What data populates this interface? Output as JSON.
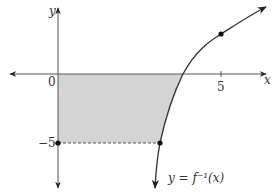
{
  "diagram": {
    "type": "function-graph",
    "function_label": "y = f⁻¹(x)",
    "axes": {
      "x_label": "x",
      "y_label": "y",
      "origin_label": "0",
      "x_tick_labels": [
        "5"
      ],
      "y_tick_labels": [
        "−5"
      ]
    },
    "points": [
      {
        "x": 5,
        "y": 3,
        "note": "point on curve above x-axis"
      },
      {
        "x": 0,
        "y": -5,
        "note": "point on y-axis"
      },
      {
        "x": 1.3,
        "y": -5,
        "note": "point on curve at y = -5"
      }
    ],
    "shaded_region": "Region bounded by the y-axis, the x-axis, the horizontal dashed line y = -5, and the curve",
    "colors": {
      "fill": "#d4d4d4",
      "axis": "#444444",
      "curve": "#333333",
      "point": "#111111"
    }
  }
}
